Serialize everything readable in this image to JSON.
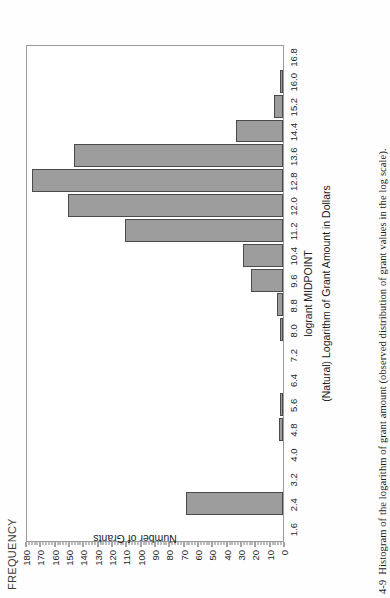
{
  "figure": {
    "frequency_header": "FREQUENCY",
    "caption_number": "4-9",
    "caption_text": "Histogram of the logarithm of grant amount (observed distribution of grant values in the log scale)."
  },
  "chart_data": {
    "type": "bar",
    "title": "",
    "xlabel": "logrant MIDPOINT",
    "xlabel2": "(Natural) Logarithm of Grant Amount in Dollars",
    "ylabel": "Number of Grants",
    "ylim": [
      0,
      180
    ],
    "ytick_step": 10,
    "grid": false,
    "legend": false,
    "orientation": "rotated-90-ccw",
    "categories": [
      "1.6",
      "2.4",
      "3.2",
      "4.0",
      "4.8",
      "5.6",
      "6.4",
      "7.2",
      "8.0",
      "8.8",
      "9.6",
      "10.4",
      "11.2",
      "12.0",
      "12.8",
      "13.6",
      "14.4",
      "15.2",
      "16.0",
      "16.8"
    ],
    "values": [
      0,
      68,
      0,
      0,
      3,
      2,
      0,
      0,
      2,
      4,
      22,
      28,
      110,
      150,
      175,
      146,
      33,
      6,
      2,
      0
    ],
    "ytick_labels": [
      "180",
      "170",
      "160",
      "150",
      "140",
      "130",
      "120",
      "110",
      "100",
      "90",
      "80",
      "70",
      "60",
      "50",
      "40",
      "30",
      "20",
      "10",
      "0"
    ],
    "ytick_values": [
      180,
      170,
      160,
      150,
      140,
      130,
      120,
      110,
      100,
      90,
      80,
      70,
      60,
      50,
      40,
      30,
      20,
      10,
      0
    ],
    "bar_fill": "#9d9d9d",
    "bar_stroke": "#4a4a4a",
    "frame_stroke": "#9a9a9a"
  }
}
